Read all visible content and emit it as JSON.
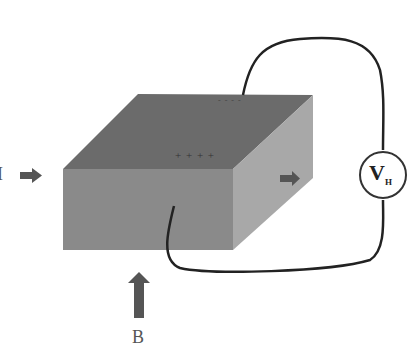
{
  "diagram": {
    "labels": {
      "current": "I",
      "magnetic_field": "B",
      "voltmeter_main": "V",
      "voltmeter_sub": "H",
      "top_charges": "- - - -",
      "bottom_charges": "+ + + +"
    },
    "colors": {
      "top_face": "#6b6b6b",
      "front_face": "#8a8a8a",
      "side_face": "#a8a8a8",
      "arrow": "#555555",
      "wire": "#222222"
    }
  }
}
